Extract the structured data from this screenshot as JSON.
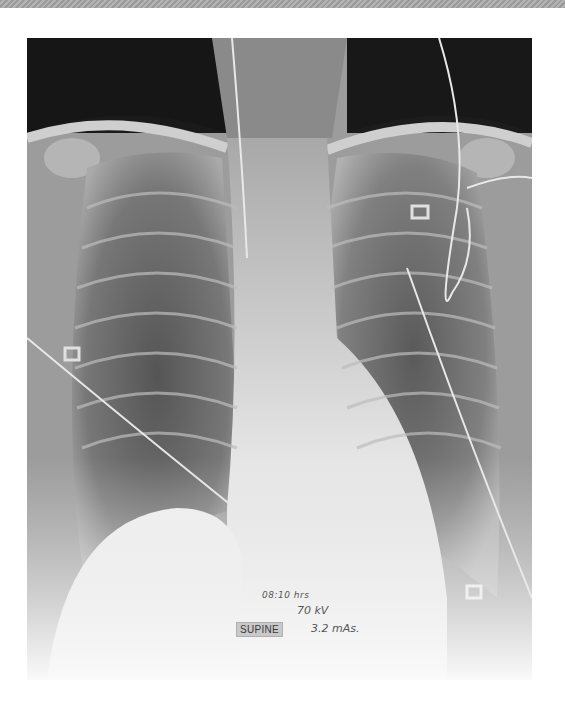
{
  "image": {
    "type": "chest radiograph",
    "view": "AP",
    "alt": "Supine AP chest X-ray with central line, ECG leads and bilateral lung opacities"
  },
  "annotations": {
    "time": "08:10 hrs",
    "kilovoltage": "70 kV",
    "position": "SUPINE",
    "exposure": "3.2 mAs."
  },
  "colors": {
    "background": "#ffffff",
    "top_band": "#a8a8a8",
    "annotation_text": "#555555",
    "position_label_bg": "#c9c9c9"
  }
}
